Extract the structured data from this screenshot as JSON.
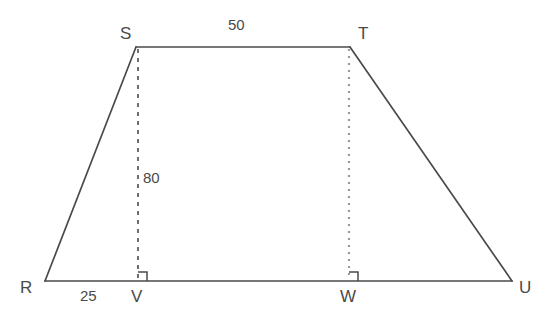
{
  "figure": {
    "kind": "trapezoid-with-altitudes",
    "background_color": "#ffffff",
    "stroke_color": "#4a4a4a",
    "dashed_stroke_color": "#3f3f3f",
    "dotted_stroke_color": "#9a9a9a",
    "text_color": "#4a4a4a"
  },
  "vertices": {
    "R": {
      "label": "R",
      "x": 45,
      "y": 281,
      "label_x": 20,
      "label_y": 279
    },
    "S": {
      "label": "S",
      "x": 136,
      "y": 47,
      "label_x": 120,
      "label_y": 25
    },
    "T": {
      "label": "T",
      "x": 350,
      "y": 47,
      "label_x": 358,
      "label_y": 25
    },
    "U": {
      "label": "U",
      "x": 512,
      "y": 281,
      "label_x": 519,
      "label_y": 279
    },
    "V": {
      "label": "V",
      "x": 138,
      "y": 281,
      "label_x": 131,
      "label_y": 288
    },
    "W": {
      "label": "W",
      "x": 349,
      "y": 281,
      "label_x": 340,
      "label_y": 288
    }
  },
  "segments": [
    {
      "name": "side-RS",
      "from": "R",
      "to": "S",
      "style": "solid"
    },
    {
      "name": "side-ST",
      "from": "S",
      "to": "T",
      "style": "solid"
    },
    {
      "name": "side-TU",
      "from": "T",
      "to": "U",
      "style": "solid"
    },
    {
      "name": "base-RU",
      "from": "R",
      "to": "U",
      "style": "solid"
    },
    {
      "name": "altitude-SV",
      "from": "S",
      "to": "V",
      "style": "dashed"
    },
    {
      "name": "altitude-TW",
      "from": "T",
      "to": "W",
      "style": "dotted"
    }
  ],
  "measurements": {
    "top_side": {
      "name": "ST",
      "value": "50",
      "x": 228,
      "y": 17
    },
    "altitude": {
      "name": "SV",
      "value": "80",
      "x": 143,
      "y": 170
    },
    "base_offset": {
      "name": "RV",
      "value": "25",
      "x": 80,
      "y": 288
    }
  },
  "right_angle_marks": [
    {
      "name": "right-angle-at-V",
      "x": 138,
      "y": 281,
      "size": 9
    },
    {
      "name": "right-angle-at-W",
      "x": 349,
      "y": 281,
      "size": 9
    }
  ]
}
